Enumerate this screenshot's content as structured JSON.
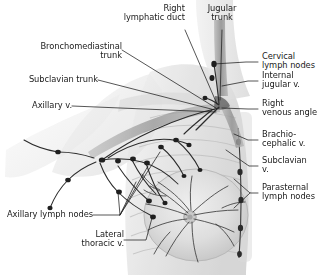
{
  "figure": {
    "background_color": "#ffffff",
    "ink_color": "#1a1a1a",
    "leader_color": "#222222",
    "vessel_color": "#2a2a2a",
    "body_tone": "#d9d9d9"
  },
  "labels": [
    {
      "id": "right-lymphatic-duct",
      "text": "Right\nlymphatic duct",
      "align": "right"
    },
    {
      "id": "jugular-trunk",
      "text": "Jugular\ntrunk",
      "align": "center"
    },
    {
      "id": "bronchomediastinal-trunk",
      "text": "Bronchomediastinal\ntrunk",
      "align": "right"
    },
    {
      "id": "subclavian-trunk",
      "text": "Subclavian trunk",
      "align": "right"
    },
    {
      "id": "axillary-v",
      "text": "Axillary v.",
      "align": "right"
    },
    {
      "id": "cervical-lymph-nodes",
      "text": "Cervical\nlymph nodes",
      "align": "left"
    },
    {
      "id": "internal-jugular-v",
      "text": "Internal\njugular v.",
      "align": "left"
    },
    {
      "id": "right-venous-angle",
      "text": "Right\nvenous angle",
      "align": "left"
    },
    {
      "id": "brachiocephalic-v",
      "text": "Brachio-\ncephalic v.",
      "align": "left"
    },
    {
      "id": "subclavian-v",
      "text": "Subclavian\nv.",
      "align": "left"
    },
    {
      "id": "parasternal-lymph-nodes",
      "text": "Parasternal\nlymph nodes",
      "align": "left"
    },
    {
      "id": "axillary-lymph-nodes",
      "text": "Axillary lymph nodes",
      "align": "right"
    },
    {
      "id": "lateral-thoracic-v",
      "text": "Lateral\nthoracic v.",
      "align": "right"
    }
  ],
  "caption": {
    "text": ""
  }
}
